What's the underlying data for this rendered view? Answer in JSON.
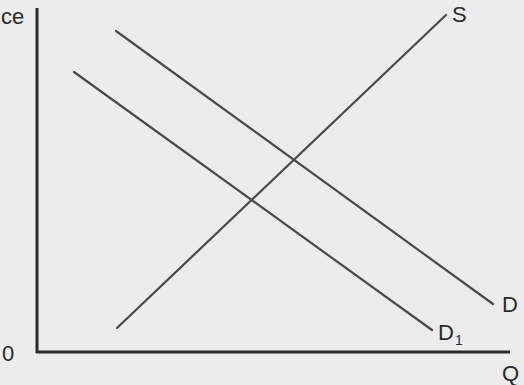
{
  "diagram": {
    "type": "supply-demand",
    "axes": {
      "y_label": "ce",
      "x_label": "Q",
      "origin_label": "0"
    },
    "curves": [
      {
        "id": "S",
        "label": "S",
        "subscript": "",
        "x1": 117,
        "y1": 328,
        "x2": 446,
        "y2": 15
      },
      {
        "id": "D",
        "label": "D",
        "subscript": "",
        "x1": 116,
        "y1": 31,
        "x2": 493,
        "y2": 304
      },
      {
        "id": "D1",
        "label": "D",
        "subscript": "1",
        "x1": 74,
        "y1": 72,
        "x2": 432,
        "y2": 330
      }
    ],
    "colors": {
      "background": "#ececec",
      "axis": "#2b2b2b",
      "curve": "#4a4a4a",
      "text": "#2a2a2a"
    }
  }
}
